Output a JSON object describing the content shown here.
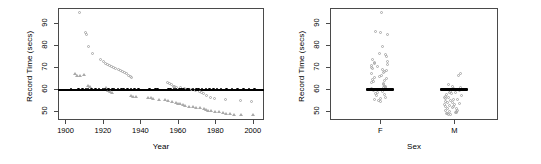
{
  "figure": {
    "background": "#ffffff",
    "point_color": "#a9a9a9",
    "reference_color": "#000000",
    "axis_color": "#4a4a4a"
  },
  "panels": [
    {
      "id": "year-panel",
      "ylabel": "Record Time (secs)",
      "xlabel": "Year",
      "yticks": [
        50,
        60,
        70,
        80,
        90
      ],
      "xticks": [
        1900,
        1920,
        1940,
        1960,
        1980,
        2000
      ],
      "ylim": [
        46,
        97
      ],
      "xlim": [
        1896,
        2006
      ],
      "reference_line_y": 60
    },
    {
      "id": "sex-panel",
      "ylabel": "Record Time (secs)",
      "xlabel": "Sex",
      "yticks": [
        50,
        60,
        70,
        80,
        90
      ],
      "xticks": [
        "F",
        "M"
      ],
      "ylim": [
        46,
        97
      ],
      "reference_line_y": 60
    }
  ],
  "chart_data": [
    {
      "type": "scatter",
      "title": "",
      "xlabel": "Year",
      "ylabel": "Record Time (secs)",
      "xlim": [
        1896,
        2006
      ],
      "ylim": [
        46,
        97
      ],
      "xticks": [
        1900,
        1920,
        1940,
        1960,
        1980,
        2000
      ],
      "yticks": [
        50,
        60,
        70,
        80,
        90
      ],
      "grid": false,
      "legend": "none",
      "annotations": [
        {
          "type": "hline",
          "y": 60,
          "color": "#000000",
          "label": "reference line at 60 secs"
        }
      ],
      "series": [
        {
          "name": "women-records",
          "marker": "circle",
          "color": "#a9a9a9",
          "points": [
            [
              1908,
              94.6
            ],
            [
              1911,
              85.5
            ],
            [
              1912,
              84.5
            ],
            [
              1913,
              79.0
            ],
            [
              1915,
              76.0
            ],
            [
              1919,
              73.0
            ],
            [
              1921,
              72.0
            ],
            [
              1922,
              71.4
            ],
            [
              1923,
              71.0
            ],
            [
              1924,
              70.4
            ],
            [
              1925,
              70.0
            ],
            [
              1926,
              69.4
            ],
            [
              1927,
              69.0
            ],
            [
              1929,
              68.4
            ],
            [
              1930,
              68.0
            ],
            [
              1931,
              67.6
            ],
            [
              1932,
              67.0
            ],
            [
              1933,
              66.6
            ],
            [
              1934,
              66.0
            ],
            [
              1935,
              65.4
            ],
            [
              1936,
              65.0
            ],
            [
              1955,
              62.5
            ],
            [
              1956,
              62.0
            ],
            [
              1957,
              61.5
            ],
            [
              1958,
              61.0
            ],
            [
              1959,
              60.8
            ],
            [
              1960,
              60.5
            ],
            [
              1962,
              60.2
            ],
            [
              1964,
              60.0
            ],
            [
              1968,
              59.5
            ],
            [
              1970,
              59.0
            ],
            [
              1972,
              58.6
            ],
            [
              1973,
              58.0
            ],
            [
              1974,
              57.5
            ],
            [
              1976,
              56.6
            ],
            [
              1978,
              56.0
            ],
            [
              1980,
              55.4
            ],
            [
              1986,
              55.0
            ],
            [
              1994,
              54.6
            ],
            [
              2000,
              54.0
            ]
          ]
        },
        {
          "name": "men-records",
          "marker": "triangle",
          "color": "#a9a9a9",
          "points": [
            [
              1905,
              66.8
            ],
            [
              1906,
              66.0
            ],
            [
              1908,
              65.8
            ],
            [
              1910,
              66.2
            ],
            [
              1912,
              61.6
            ],
            [
              1913,
              61.0
            ],
            [
              1922,
              60.4
            ],
            [
              1923,
              59.0
            ],
            [
              1924,
              58.6
            ],
            [
              1925,
              58.0
            ],
            [
              1935,
              57.0
            ],
            [
              1936,
              56.6
            ],
            [
              1938,
              56.4
            ],
            [
              1944,
              56.0
            ],
            [
              1946,
              55.8
            ],
            [
              1947,
              55.4
            ],
            [
              1950,
              55.0
            ],
            [
              1953,
              54.8
            ],
            [
              1955,
              54.6
            ],
            [
              1957,
              54.0
            ],
            [
              1959,
              53.6
            ],
            [
              1960,
              53.4
            ],
            [
              1961,
              53.0
            ],
            [
              1963,
              52.8
            ],
            [
              1964,
              52.4
            ],
            [
              1966,
              52.0
            ],
            [
              1968,
              51.8
            ],
            [
              1970,
              51.6
            ],
            [
              1972,
              51.4
            ],
            [
              1974,
              51.0
            ],
            [
              1975,
              50.6
            ],
            [
              1976,
              50.0
            ],
            [
              1978,
              49.8
            ],
            [
              1980,
              49.6
            ],
            [
              1982,
              49.4
            ],
            [
              1984,
              49.0
            ],
            [
              1986,
              48.8
            ],
            [
              1988,
              48.6
            ],
            [
              1990,
              48.4
            ],
            [
              1994,
              48.2
            ],
            [
              2000,
              48.0
            ]
          ]
        },
        {
          "name": "reference-60",
          "marker": "dot",
          "color": "#000000",
          "points": [
            [
              1903,
              60
            ],
            [
              1907,
              60
            ],
            [
              1909,
              60
            ],
            [
              1911,
              60
            ],
            [
              1912,
              60
            ],
            [
              1914,
              60
            ],
            [
              1916,
              60
            ],
            [
              1918,
              60
            ],
            [
              1920,
              60
            ],
            [
              1921,
              60
            ],
            [
              1923,
              60
            ],
            [
              1925,
              60
            ],
            [
              1926,
              60
            ],
            [
              1928,
              60
            ],
            [
              1930,
              60
            ],
            [
              1931,
              60
            ],
            [
              1933,
              60
            ],
            [
              1935,
              60
            ],
            [
              1937,
              60
            ],
            [
              1939,
              60
            ],
            [
              1945,
              60
            ],
            [
              1948,
              60
            ],
            [
              1949,
              60
            ],
            [
              1955,
              60
            ],
            [
              1956,
              60
            ],
            [
              1958,
              60
            ],
            [
              1959,
              60
            ],
            [
              1961,
              60
            ],
            [
              1962,
              60
            ],
            [
              1963,
              60
            ],
            [
              1965,
              60
            ],
            [
              1966,
              60
            ],
            [
              1968,
              60
            ],
            [
              1970,
              60
            ],
            [
              1971,
              60
            ],
            [
              1973,
              60
            ],
            [
              1975,
              60
            ],
            [
              1977,
              60
            ],
            [
              1979,
              60
            ],
            [
              1981,
              60
            ],
            [
              1983,
              60
            ],
            [
              1986,
              60
            ],
            [
              1989,
              60
            ],
            [
              1992,
              60
            ],
            [
              1995,
              60
            ],
            [
              1998,
              60
            ],
            [
              2001,
              60
            ]
          ]
        }
      ]
    },
    {
      "type": "scatter",
      "title": "",
      "xlabel": "Sex",
      "ylabel": "Record Time (secs)",
      "categories": [
        "F",
        "M"
      ],
      "ylim": [
        46,
        97
      ],
      "yticks": [
        50,
        60,
        70,
        80,
        90
      ],
      "grid": false,
      "legend": "none",
      "annotations": [
        {
          "type": "bar",
          "category": "F",
          "y": 60,
          "color": "#000000",
          "label": "median marker"
        },
        {
          "type": "bar",
          "category": "M",
          "y": 60,
          "color": "#000000",
          "label": "median marker"
        }
      ],
      "series": [
        {
          "name": "F",
          "marker": "circle",
          "color": "#a9a9a9",
          "values": [
            94.6,
            86.0,
            85.5,
            84.5,
            79.0,
            76.0,
            75.5,
            74.5,
            73.0,
            72.0,
            71.6,
            71.4,
            71.0,
            70.4,
            70.0,
            69.4,
            69.0,
            68.4,
            68.0,
            67.6,
            67.0,
            66.6,
            66.0,
            65.4,
            65.0,
            64.5,
            64.0,
            63.5,
            63.0,
            62.5,
            62.0,
            61.5,
            61.0,
            60.8,
            60.5,
            60.2,
            60.0,
            59.5,
            59.0,
            58.6,
            58.0,
            57.5,
            57.0,
            56.6,
            56.0,
            55.4,
            55.0,
            54.6,
            54.0
          ]
        },
        {
          "name": "M",
          "marker": "circle",
          "color": "#a9a9a9",
          "values": [
            66.8,
            66.0,
            61.6,
            61.0,
            60.4,
            60.0,
            59.4,
            59.0,
            58.6,
            58.2,
            58.0,
            57.6,
            57.0,
            56.6,
            56.4,
            56.0,
            55.8,
            55.4,
            55.0,
            54.8,
            54.6,
            54.0,
            53.6,
            53.4,
            53.0,
            52.8,
            52.4,
            52.0,
            51.8,
            51.6,
            51.4,
            51.0,
            50.6,
            50.0,
            49.8,
            49.6,
            49.4,
            49.0,
            48.8,
            48.6,
            48.4,
            48.2,
            48.0
          ]
        }
      ]
    }
  ]
}
